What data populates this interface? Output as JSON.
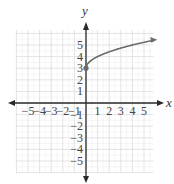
{
  "chart_data": {
    "type": "line",
    "title": "",
    "xlabel": "x",
    "ylabel": "y",
    "xlim": [
      -6,
      6
    ],
    "ylim": [
      -6,
      6
    ],
    "grid": true,
    "x_ticks": [
      "-5",
      "-4",
      "-3",
      "-2",
      "-1",
      "1",
      "2",
      "3",
      "4",
      "5"
    ],
    "y_ticks": [
      "5",
      "4",
      "3",
      "2",
      "1",
      "-1",
      "-2",
      "-3",
      "-4",
      "-5"
    ],
    "series": [
      {
        "name": "y = sqrt(x) + 3",
        "x": [
          0,
          0.25,
          0.5,
          1,
          1.5,
          2,
          2.5,
          3,
          3.5,
          4,
          4.5,
          5,
          5.5,
          5.8
        ],
        "values": [
          3,
          3.5,
          3.71,
          4,
          4.22,
          4.41,
          4.58,
          4.73,
          4.87,
          5,
          5.12,
          5.24,
          5.35,
          5.41
        ],
        "start_point": {
          "x": 0,
          "y": 3,
          "closed": true
        },
        "end_arrow": true
      }
    ],
    "colors": {
      "curve": "#6b6b6b",
      "axis": "#2a2a2a",
      "grid": "#dcdcdc"
    }
  }
}
